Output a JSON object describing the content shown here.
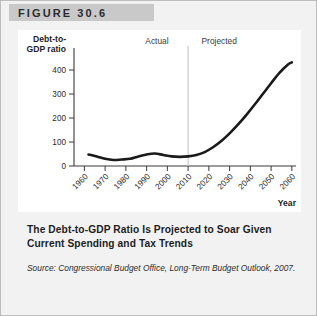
{
  "figure": {
    "banner_label": "FIGURE 30.6",
    "caption": "The Debt-to-GDP Ratio Is Projected to Soar Given Current Spending and Tax Trends",
    "source": "Source: Congressional Budget Office, Long-Term Budget Outlook, 2007."
  },
  "chart_data": {
    "type": "line",
    "title": "",
    "xlabel": "Year",
    "ylabel": "Debt-to-GDP ratio",
    "xlim": [
      1955,
      2062
    ],
    "ylim": [
      0,
      450
    ],
    "xticks": [
      1960,
      1970,
      1980,
      1990,
      2000,
      2010,
      2020,
      2030,
      2040,
      2050,
      2060
    ],
    "yticks": [
      0,
      100,
      200,
      300,
      400
    ],
    "grid": false,
    "legend": false,
    "annotations": [
      {
        "text": "Actual",
        "x": 1995
      },
      {
        "text": "Projected",
        "x": 2025
      }
    ],
    "divider_x": 2010,
    "series": [
      {
        "name": "Debt-to-GDP ratio",
        "x": [
          1962,
          1966,
          1970,
          1974,
          1978,
          1982,
          1986,
          1990,
          1994,
          1998,
          2002,
          2006,
          2010,
          2014,
          2018,
          2022,
          2026,
          2030,
          2034,
          2038,
          2042,
          2046,
          2050,
          2054,
          2058,
          2060
        ],
        "values": [
          48,
          40,
          30,
          25,
          27,
          30,
          40,
          48,
          52,
          46,
          40,
          38,
          40,
          46,
          58,
          78,
          104,
          136,
          172,
          212,
          255,
          300,
          345,
          388,
          422,
          432
        ]
      }
    ]
  }
}
